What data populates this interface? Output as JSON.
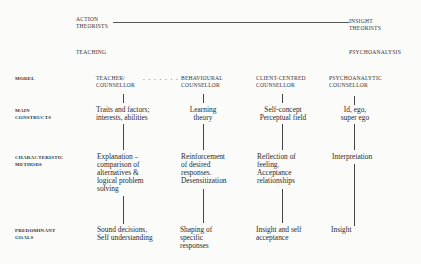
{
  "spectrum": {
    "left_label": "ACTION\nTHEORISTS",
    "right_label": "INSIGHT\nTHEORISTS",
    "left_pole": "TEACHING",
    "right_pole": "PSYCHOANALYSIS"
  },
  "rows": {
    "model": "MODEL",
    "constructs": "MAIN\nCONSTRUCTS",
    "methods": "CHARACTERISTIC\nMETHODS",
    "goals": "PREDOMINANT\nGOALS"
  },
  "connector_dots": ". . . . . . .",
  "columns": [
    {
      "model": "TEACHER/\nCOUNSELLOR",
      "constructs": "Traits and factors;\ninterests, abilities",
      "methods": "Explanation –\ncomparison of\nalternatives &\nlogical problem\nsolving",
      "goals": "Sound decisions,\nSelf understanding"
    },
    {
      "model": "BEHAVIOURAL\nCOUNSELLOR",
      "constructs": "Learning\ntheory",
      "methods": "Reinforcement\nof desired\nresponses.\nDesensitization",
      "goals": "Shaping of\nspecific\nresponses"
    },
    {
      "model": "CLIENT-CENTRED\nCOUNSELLOR",
      "constructs": "Self-concept\nPerceptual field",
      "methods": "Reflection of\nfeeling.\nAcceptance\nrelationships",
      "goals": "Insight and self\nacceptance"
    },
    {
      "model": "PSYCHOANALYTIC\nCOUNSELLOR",
      "constructs": "Id, ego,\nsuper ego",
      "methods": "Interpretation",
      "goals": "Insight"
    }
  ]
}
